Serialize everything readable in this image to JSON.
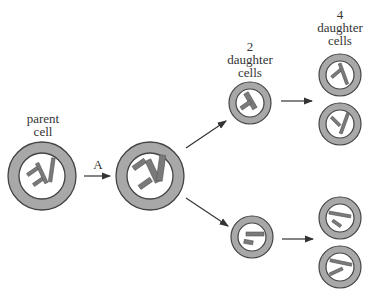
{
  "diagram": {
    "type": "cell division (meiosis)",
    "labels": {
      "parent": [
        "parent",
        "cell"
      ],
      "step": "A",
      "two_daughter": [
        "2",
        "daughter",
        "cells"
      ],
      "four_daughter": [
        "4",
        "daughter",
        "cells"
      ]
    },
    "colors": {
      "cell_ring": "#a8a8a8",
      "cell_outline": "#444444",
      "cell_interior": "#ffffff",
      "chromosome": "#7a7a7a",
      "arrow": "#333333",
      "text": "#333333"
    },
    "cells": [
      {
        "id": "parent",
        "cx": 42,
        "cy": 176,
        "r": 36
      },
      {
        "id": "after-A",
        "cx": 150,
        "cy": 176,
        "r": 36
      },
      {
        "id": "daughter-2-top",
        "cx": 250,
        "cy": 103,
        "r": 22
      },
      {
        "id": "daughter-2-bottom",
        "cx": 252,
        "cy": 237,
        "r": 22
      },
      {
        "id": "daughter-4-1",
        "cx": 340,
        "cy": 75,
        "r": 22
      },
      {
        "id": "daughter-4-2",
        "cx": 340,
        "cy": 124,
        "r": 22
      },
      {
        "id": "daughter-4-3",
        "cx": 340,
        "cy": 218,
        "r": 22
      },
      {
        "id": "daughter-4-4",
        "cx": 340,
        "cy": 267,
        "r": 22
      }
    ]
  }
}
